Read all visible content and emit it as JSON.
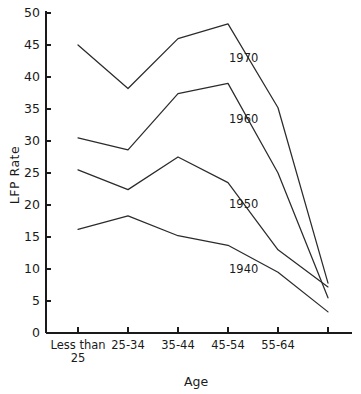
{
  "chart_data": {
    "type": "line",
    "title": "",
    "xlabel": "Age",
    "ylabel": "LFP Rate",
    "categories": [
      "Less than 25",
      "25-34",
      "35-44",
      "45-54",
      "55-64",
      ""
    ],
    "category_labels": [
      {
        "line1": "Less than",
        "line2": "25"
      },
      {
        "line1": "25-34",
        "line2": ""
      },
      {
        "line1": "35-44",
        "line2": ""
      },
      {
        "line1": "45-54",
        "line2": ""
      },
      {
        "line1": "55-64",
        "line2": ""
      },
      {
        "line1": "",
        "line2": ""
      }
    ],
    "ylim": [
      0,
      50
    ],
    "yticks": [
      0,
      5,
      10,
      15,
      20,
      25,
      30,
      35,
      40,
      45,
      50
    ],
    "ytick_labels": [
      "0",
      "5",
      "10",
      "15",
      "20",
      "25",
      "30",
      "35",
      "40",
      "45",
      "50"
    ],
    "grid": false,
    "legend": "inline-annotations",
    "series": [
      {
        "name": "1970",
        "values": [
          45.0,
          38.2,
          46.0,
          48.3,
          35.2,
          7.8
        ],
        "label_x": 3.02,
        "label_y": 42.3
      },
      {
        "name": "1960",
        "values": [
          30.5,
          28.6,
          37.4,
          39.0,
          25.0,
          5.5
        ],
        "label_x": 3.02,
        "label_y": 32.8
      },
      {
        "name": "1950",
        "values": [
          25.5,
          22.4,
          27.5,
          23.5,
          13.0,
          7.2
        ],
        "label_x": 3.02,
        "label_y": 19.5
      },
      {
        "name": "1940",
        "values": [
          16.2,
          18.3,
          15.2,
          13.7,
          9.5,
          3.3
        ],
        "label_x": 3.02,
        "label_y": 9.3
      }
    ]
  }
}
